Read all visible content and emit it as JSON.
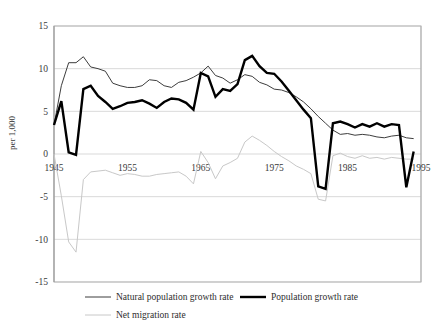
{
  "chart_data": {
    "type": "line",
    "title": "",
    "xlabel": "",
    "ylabel": "per 1,000",
    "xlim": [
      1945,
      1995
    ],
    "ylim": [
      -15,
      15
    ],
    "grid": true,
    "legend_position": "bottom",
    "x_ticks": [
      "1945",
      "1955",
      "1965",
      "1975",
      "1985",
      "1995"
    ],
    "x_tick_values": [
      1945,
      1955,
      1965,
      1975,
      1985,
      1995
    ],
    "y_ticks": [
      "15",
      "10",
      "5",
      "0",
      "-5",
      "-10",
      "-15"
    ],
    "y_tick_values": [
      15,
      10,
      5,
      0,
      -5,
      -10,
      -15
    ],
    "x": [
      1945,
      1946,
      1947,
      1948,
      1949,
      1950,
      1951,
      1952,
      1953,
      1954,
      1955,
      1956,
      1957,
      1958,
      1959,
      1960,
      1961,
      1962,
      1963,
      1964,
      1965,
      1966,
      1967,
      1968,
      1969,
      1970,
      1971,
      1972,
      1973,
      1974,
      1975,
      1976,
      1977,
      1978,
      1979,
      1980,
      1981,
      1982,
      1983,
      1984,
      1985,
      1986,
      1987,
      1988,
      1989,
      1990,
      1991,
      1992,
      1993,
      1994
    ],
    "series": [
      {
        "name": "Natural population growth rate",
        "color": "#3d3d3d",
        "width": 1.0,
        "values": [
          3.4,
          8.0,
          10.7,
          10.7,
          11.4,
          10.2,
          10.0,
          9.7,
          8.3,
          8.0,
          7.8,
          7.8,
          8.0,
          8.7,
          8.6,
          8.0,
          7.8,
          8.4,
          8.6,
          9.0,
          9.5,
          10.3,
          9.2,
          8.9,
          8.3,
          8.7,
          9.3,
          9.1,
          8.4,
          8.1,
          7.6,
          7.5,
          7.2,
          6.7,
          6.1,
          5.3,
          4.4,
          3.6,
          2.8,
          2.3,
          2.4,
          2.2,
          2.3,
          2.2,
          2.0,
          1.9,
          2.1,
          2.2,
          1.9,
          1.8
        ]
      },
      {
        "name": "Population growth rate",
        "color": "#000000",
        "width": 2.4,
        "values": [
          3.4,
          6.2,
          0.2,
          -0.1,
          7.6,
          8.0,
          6.8,
          6.1,
          5.3,
          5.6,
          6.0,
          6.1,
          6.3,
          5.9,
          5.4,
          6.1,
          6.5,
          6.4,
          6.0,
          5.2,
          9.5,
          9.1,
          6.7,
          7.6,
          7.4,
          8.2,
          11.0,
          11.5,
          10.3,
          9.5,
          9.4,
          8.5,
          7.4,
          6.3,
          5.2,
          4.2,
          -3.8,
          -4.1,
          3.6,
          3.8,
          3.5,
          3.1,
          3.5,
          3.2,
          3.6,
          3.2,
          3.5,
          3.4,
          -3.9,
          0.3
        ]
      },
      {
        "name": "Net migration rate",
        "color": "#c8c8c8",
        "width": 1.0,
        "values": [
          0.0,
          -4.9,
          -10.3,
          -11.5,
          -3.0,
          -2.1,
          -2.0,
          -1.9,
          -2.2,
          -2.5,
          -2.3,
          -2.4,
          -2.6,
          -2.6,
          -2.4,
          -2.3,
          -2.2,
          -2.1,
          -2.6,
          -3.5,
          0.3,
          -1.0,
          -2.9,
          -1.4,
          -1.0,
          -0.5,
          1.4,
          2.1,
          1.6,
          1.0,
          0.3,
          -0.3,
          -0.8,
          -1.4,
          -1.8,
          -2.3,
          -5.3,
          -5.5,
          -0.2,
          0.1,
          -0.3,
          -0.5,
          -0.2,
          -0.5,
          -0.4,
          -0.6,
          -0.4,
          -0.5,
          -0.6,
          -0.6
        ]
      }
    ]
  },
  "legend": {
    "items": [
      {
        "label": "Natural population growth rate",
        "key": "natural-population-growth-rate"
      },
      {
        "label": "Population growth rate",
        "key": "population-growth-rate"
      },
      {
        "label": "Net migration rate",
        "key": "net-migration-rate"
      }
    ]
  },
  "axis": {
    "y_title": "per 1,000"
  }
}
